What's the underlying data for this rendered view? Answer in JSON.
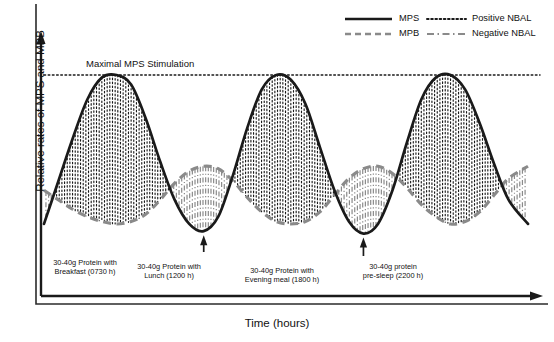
{
  "figure": {
    "ylabel": "Relative rates of MPS and MPB",
    "xlabel": "Time (hours)",
    "threshold_label": "Maximal MPS Stimulation"
  },
  "legend": {
    "items": [
      {
        "label": "MPS",
        "style": "solid",
        "color": "#1a1a1a"
      },
      {
        "label": "Positive NBAL",
        "style": "dotted",
        "color": "#1a1a1a"
      },
      {
        "label": "MPB",
        "style": "dashed",
        "color": "#8a8a8a"
      },
      {
        "label": "Negative NBAL",
        "style": "dashdot",
        "color": "#8a8a8a"
      }
    ]
  },
  "annotations": [
    {
      "line1": "30-40g Protein with",
      "line2": "Breakfast (0730 h)"
    },
    {
      "line1": "30-40g Protein with",
      "line2": "Lunch (1200 h)"
    },
    {
      "line1": "30-40g Protein with",
      "line2": "Evening meal (1800 h)"
    },
    {
      "line1": "30-40g protein",
      "line2": "pre-sleep (2200 h)"
    }
  ],
  "chart_data": {
    "type": "line",
    "title": "",
    "xlabel": "Time (hours)",
    "ylabel": "Relative rates of MPS and MPB",
    "xlim": [
      0,
      100
    ],
    "ylim": [
      0,
      100
    ],
    "grid": false,
    "legend_position": "top-right",
    "threshold": {
      "label": "Maximal MPS Stimulation",
      "value": 92,
      "style": "dotted"
    },
    "meal_times": [
      "0730 h",
      "1200 h",
      "1800 h",
      "2200 h"
    ],
    "meal_protein": "30-40g",
    "series": [
      {
        "name": "MPS",
        "style": "solid",
        "color": "#1a1a1a",
        "x": [
          0,
          3,
          6,
          9,
          12,
          15,
          18,
          21,
          24,
          27,
          30,
          33,
          36,
          39,
          42,
          45,
          48,
          51,
          54,
          57,
          60,
          63,
          66,
          69,
          72,
          75,
          78,
          81,
          84,
          87,
          90,
          93,
          96,
          100
        ],
        "y": [
          30,
          48,
          66,
          82,
          91,
          92,
          88,
          74,
          56,
          40,
          30,
          27,
          33,
          50,
          70,
          86,
          92,
          90,
          80,
          62,
          44,
          31,
          26,
          30,
          44,
          64,
          82,
          91,
          92,
          86,
          72,
          55,
          40,
          30
        ]
      },
      {
        "name": "MPB",
        "style": "dashed",
        "color": "#8a8a8a",
        "x": [
          0,
          3,
          6,
          9,
          12,
          15,
          18,
          21,
          24,
          27,
          30,
          33,
          36,
          39,
          42,
          45,
          48,
          51,
          54,
          57,
          60,
          63,
          66,
          69,
          72,
          75,
          78,
          81,
          84,
          87,
          90,
          93,
          96,
          100
        ],
        "y": [
          44,
          40,
          36,
          33,
          31,
          30,
          31,
          34,
          40,
          47,
          52,
          54,
          53,
          48,
          41,
          35,
          31,
          30,
          31,
          35,
          42,
          49,
          53,
          54,
          51,
          45,
          38,
          33,
          30,
          31,
          35,
          42,
          49,
          54
        ]
      }
    ],
    "fills": [
      {
        "name": "Positive NBAL",
        "description": "Region where MPS exceeds MPB",
        "style": "vertical-dotted",
        "color": "#1a1a1a"
      },
      {
        "name": "Negative NBAL",
        "description": "Region where MPB exceeds MPS",
        "style": "vertical-dashdot",
        "color": "#8a8a8a"
      }
    ]
  }
}
